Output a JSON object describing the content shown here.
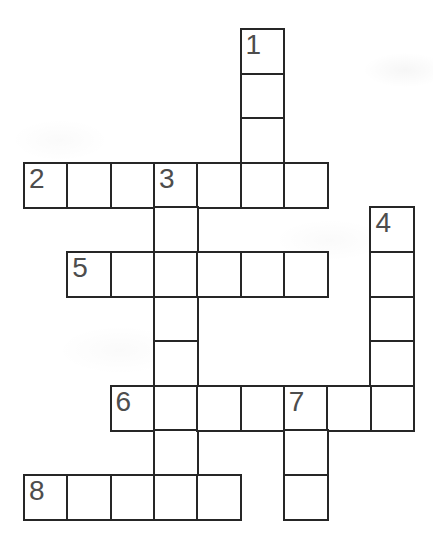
{
  "puzzle": {
    "kind": "crossword-grid",
    "grid_line_color": "#262626",
    "number_color": "#4d4d4d",
    "cell_background": "#ffffff",
    "page_background": "#ffffff",
    "rows": 11,
    "cols": 9,
    "words": [
      {
        "num": "1",
        "dir": "down",
        "row": 0,
        "col": 5,
        "len": 4
      },
      {
        "num": "2",
        "dir": "across",
        "row": 3,
        "col": 0,
        "len": 7
      },
      {
        "num": "3",
        "dir": "down",
        "row": 3,
        "col": 3,
        "len": 8
      },
      {
        "num": "4",
        "dir": "down",
        "row": 4,
        "col": 8,
        "len": 5
      },
      {
        "num": "5",
        "dir": "across",
        "row": 5,
        "col": 1,
        "len": 6
      },
      {
        "num": "6",
        "dir": "across",
        "row": 8,
        "col": 2,
        "len": 7
      },
      {
        "num": "7",
        "dir": "down",
        "row": 8,
        "col": 6,
        "len": 3
      },
      {
        "num": "8",
        "dir": "across",
        "row": 10,
        "col": 0,
        "len": 5
      }
    ],
    "cell_value_placeholder": ""
  }
}
